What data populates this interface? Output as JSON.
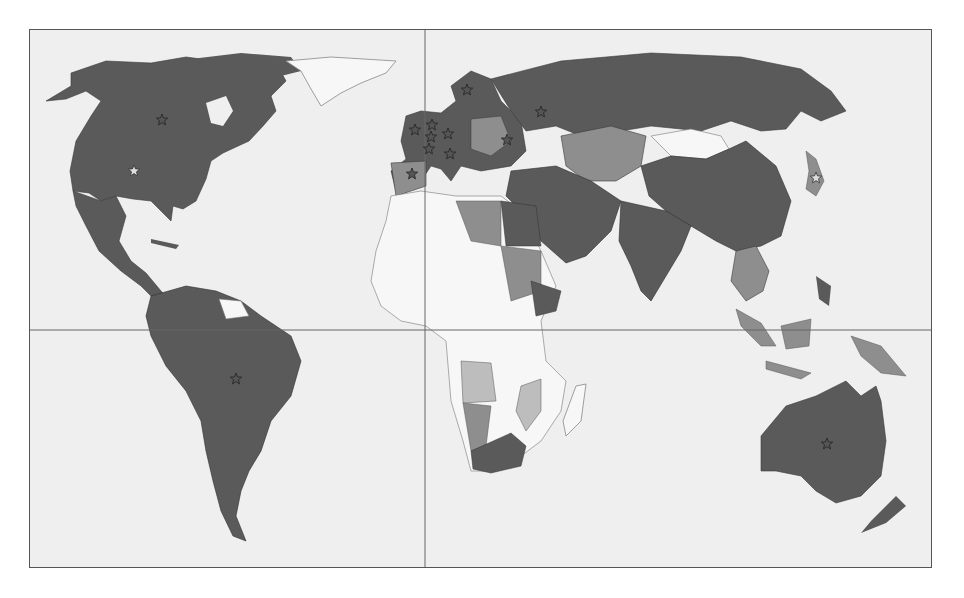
{
  "map": {
    "type": "choropleth-world",
    "projection": "equirectangular-like",
    "colors": {
      "background": "#ffffff",
      "ocean": "#efefef",
      "frame": "#555555",
      "grid_lines": "#666666",
      "category_dark": "#5a5a5a",
      "category_mid": "#8e8e8e",
      "category_light": "#bdbdbd",
      "category_none": "#f7f7f7",
      "borders": "#2f2f2f"
    },
    "grid": {
      "equator_y": 329,
      "prime_meridian_x": 424
    },
    "legend": null,
    "title": null,
    "regions": [
      {
        "name": "North America",
        "shade": "dark"
      },
      {
        "name": "Greenland",
        "shade": "none"
      },
      {
        "name": "Central America & Caribbean",
        "shade": "dark"
      },
      {
        "name": "South America",
        "shade": "dark"
      },
      {
        "name": "Guianas",
        "shade": "none"
      },
      {
        "name": "Europe",
        "shade": "dark"
      },
      {
        "name": "Russia",
        "shade": "dark"
      },
      {
        "name": "Central Asia",
        "shade": "mid"
      },
      {
        "name": "Middle East",
        "shade": "dark"
      },
      {
        "name": "South Asia",
        "shade": "dark"
      },
      {
        "name": "China",
        "shade": "dark"
      },
      {
        "name": "Mongolia",
        "shade": "none"
      },
      {
        "name": "Japan",
        "shade": "mid"
      },
      {
        "name": "Southeast Asia",
        "shade": "mid"
      },
      {
        "name": "Indonesia",
        "shade": "mid"
      },
      {
        "name": "Australia",
        "shade": "dark"
      },
      {
        "name": "New Zealand",
        "shade": "dark"
      },
      {
        "name": "North Africa (Libya, Sudan)",
        "shade": "mid"
      },
      {
        "name": "Egypt / Ethiopia",
        "shade": "dark"
      },
      {
        "name": "Sub-Saharan Africa",
        "shade": "none"
      },
      {
        "name": "Angola / Mozambique",
        "shade": "light"
      },
      {
        "name": "Namibia / Zimbabwe",
        "shade": "mid"
      },
      {
        "name": "South Africa",
        "shade": "dark"
      },
      {
        "name": "Madagascar",
        "shade": "none"
      }
    ],
    "markers": [
      {
        "name": "Canada",
        "x": 161,
        "y": 119,
        "style": "dark"
      },
      {
        "name": "United States",
        "x": 133,
        "y": 170,
        "style": "light"
      },
      {
        "name": "Brazil",
        "x": 235,
        "y": 378,
        "style": "dark"
      },
      {
        "name": "United Kingdom",
        "x": 414,
        "y": 129,
        "style": "dark"
      },
      {
        "name": "Netherlands",
        "x": 431,
        "y": 124,
        "style": "dark"
      },
      {
        "name": "Belgium",
        "x": 430,
        "y": 136,
        "style": "dark"
      },
      {
        "name": "France",
        "x": 428,
        "y": 148,
        "style": "dark"
      },
      {
        "name": "Germany",
        "x": 447,
        "y": 133,
        "style": "dark"
      },
      {
        "name": "Italy",
        "x": 449,
        "y": 153,
        "style": "dark"
      },
      {
        "name": "Spain",
        "x": 411,
        "y": 173,
        "style": "dark"
      },
      {
        "name": "Sweden",
        "x": 466,
        "y": 89,
        "style": "dark"
      },
      {
        "name": "Ukraine",
        "x": 506,
        "y": 139,
        "style": "dark"
      },
      {
        "name": "Russia",
        "x": 540,
        "y": 111,
        "style": "dark"
      },
      {
        "name": "Japan",
        "x": 815,
        "y": 177,
        "style": "light"
      },
      {
        "name": "Australia",
        "x": 826,
        "y": 443,
        "style": "dark"
      }
    ]
  }
}
